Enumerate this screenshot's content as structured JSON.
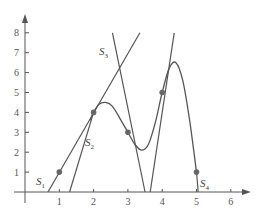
{
  "chart_data": {
    "type": "line",
    "title": "",
    "xlabel": "",
    "ylabel": "",
    "xlim": [
      -0.3,
      6.6
    ],
    "ylim": [
      -0.3,
      8.6
    ],
    "grid": false,
    "legend": "none",
    "x_ticks": [
      "1",
      "2",
      "3",
      "4",
      "5",
      "6"
    ],
    "y_ticks": [
      "1",
      "2",
      "3",
      "4",
      "5",
      "6",
      "7",
      "8"
    ],
    "points": [
      {
        "x": 1,
        "y": 1
      },
      {
        "x": 2,
        "y": 4
      },
      {
        "x": 3,
        "y": 3
      },
      {
        "x": 4,
        "y": 5
      },
      {
        "x": 5,
        "y": 1
      }
    ],
    "curve": {
      "name": "curve",
      "x": [
        1.9,
        2.0,
        2.15,
        2.35,
        2.55,
        2.8,
        3.0,
        3.2,
        3.4,
        3.6,
        3.8,
        4.0,
        4.2,
        4.4,
        4.6,
        4.8,
        5.0
      ],
      "y": [
        3.6,
        4.0,
        4.4,
        4.5,
        4.3,
        3.6,
        3.0,
        2.4,
        2.1,
        2.4,
        3.5,
        5.0,
        6.2,
        6.5,
        5.6,
        3.6,
        1.0
      ]
    },
    "series": [
      {
        "name": "S1",
        "type": "secant",
        "x": [
          0.67,
          3.35
        ],
        "y": [
          0,
          8.0
        ],
        "label_pos": [
          0.65,
          0.6
        ]
      },
      {
        "name": "S2",
        "type": "secant",
        "x": [
          1.3,
          2.0
        ],
        "y": [
          0,
          4.0
        ],
        "label_pos": [
          1.9,
          2.4
        ]
      },
      {
        "name": "S3",
        "type": "secant",
        "x": [
          2.55,
          3.5
        ],
        "y": [
          8.0,
          0
        ],
        "label_pos": [
          2.6,
          7.2
        ]
      },
      {
        "name": "S4",
        "type": "secant",
        "x": [
          5.0,
          5.05
        ],
        "y": [
          1.0,
          0
        ],
        "label_pos": [
          5.15,
          0.5
        ]
      },
      {
        "name": "",
        "type": "secant",
        "x": [
          3.65,
          4.35
        ],
        "y": [
          0,
          8.0
        ]
      }
    ],
    "annotations": [
      {
        "text": "S1",
        "x": 0.65,
        "y": 0.6
      },
      {
        "text": "S2",
        "x": 1.9,
        "y": 2.4
      },
      {
        "text": "S3",
        "x": 2.6,
        "y": 7.2
      },
      {
        "text": "S4",
        "x": 5.15,
        "y": 0.5
      }
    ]
  },
  "labels": {
    "s1": "S",
    "s1_sub": "1",
    "s2": "S",
    "s2_sub": "2",
    "s3": "S",
    "s3_sub": "3",
    "s4": "S",
    "s4_sub": "4"
  },
  "colors": {
    "line": "#555555",
    "point": "#666666",
    "axis": "#555555"
  }
}
